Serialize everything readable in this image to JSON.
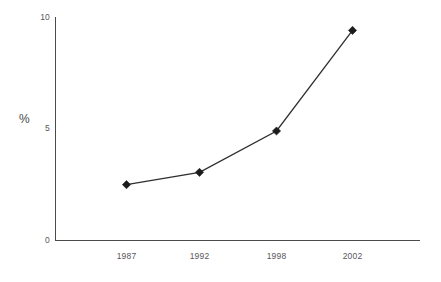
{
  "chart_data": {
    "type": "line",
    "title": "",
    "xlabel": "",
    "ylabel": "%",
    "categories": [
      "1987",
      "1992",
      "1998",
      "2002"
    ],
    "x": [
      1987,
      1992,
      1998,
      2002
    ],
    "values": [
      2.5,
      3.05,
      4.9,
      9.4
    ],
    "series": [
      {
        "name": "",
        "values": [
          2.5,
          3.05,
          4.9,
          9.4
        ]
      }
    ],
    "ylim": [
      0,
      10
    ],
    "yticks": [
      "0",
      "5",
      "10"
    ],
    "ytick_values": [
      0,
      5,
      10
    ],
    "xtick_labels": [
      "1987",
      "1992",
      "1998",
      "2002"
    ],
    "grid": false,
    "legend": "none",
    "marker": "diamond",
    "line_color": "#2e2e2e",
    "marker_color": "#1c1c1c",
    "axis_color": "#4b4b4b",
    "background_color": "#ffffff"
  }
}
